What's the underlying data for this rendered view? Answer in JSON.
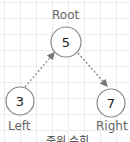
{
  "diagram": {
    "type": "binary-tree",
    "nodes": [
      {
        "id": "root",
        "value": "5",
        "label": "Root"
      },
      {
        "id": "left",
        "value": "3",
        "label": "Left"
      },
      {
        "id": "right",
        "value": "7",
        "label": "Right"
      }
    ],
    "edges": [
      {
        "from": "left",
        "to": "root",
        "style": "dotted-arrow"
      },
      {
        "from": "root",
        "to": "right",
        "style": "dotted-arrow"
      }
    ],
    "caption": "중위 순회"
  },
  "colors": {
    "stroke": "#8a8a8a",
    "text": "#222222",
    "label": "#666666",
    "grid": "#ececec"
  }
}
